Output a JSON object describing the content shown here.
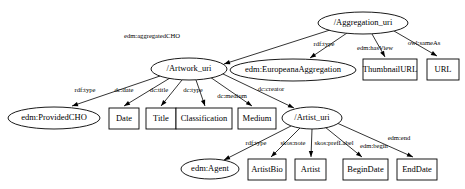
{
  "diagram": {
    "type": "rdf-graph",
    "background_color": "#ffffff",
    "stroke_color": "#000000",
    "nodes": [
      {
        "id": "aggregation_uri",
        "label": "/Aggregation_uri",
        "shape": "ellipse",
        "cx": 363,
        "cy": 23,
        "rx": 45,
        "ry": 11,
        "font_size": 8.5
      },
      {
        "id": "artwork_uri",
        "label": "/Artwork_uri",
        "shape": "ellipse",
        "cx": 189,
        "cy": 69,
        "rx": 38,
        "ry": 11,
        "font_size": 8.5
      },
      {
        "id": "europeana_agg",
        "label": "edm:EuropeanaAggregation",
        "shape": "ellipse",
        "cx": 293,
        "cy": 70,
        "rx": 63,
        "ry": 11,
        "font_size": 8.5
      },
      {
        "id": "thumbnail_url",
        "label": "ThumbnailURL",
        "shape": "rect",
        "x": 363,
        "y": 59,
        "w": 54,
        "h": 21,
        "font_size": 8.5
      },
      {
        "id": "url",
        "label": "URL",
        "shape": "rect",
        "x": 427,
        "y": 59,
        "w": 32,
        "h": 21,
        "font_size": 8.5
      },
      {
        "id": "provided_cho",
        "label": "edm:ProvidedCHO",
        "shape": "ellipse",
        "cx": 54,
        "cy": 118,
        "rx": 46,
        "ry": 11,
        "font_size": 8.5
      },
      {
        "id": "date",
        "label": "Date",
        "shape": "rect",
        "x": 109,
        "y": 108,
        "w": 30,
        "h": 21,
        "font_size": 8.5
      },
      {
        "id": "title",
        "label": "Title",
        "shape": "rect",
        "x": 146,
        "y": 108,
        "w": 30,
        "h": 21,
        "font_size": 8.5
      },
      {
        "id": "classification",
        "label": "Classification",
        "shape": "rect",
        "x": 176,
        "y": 108,
        "w": 56,
        "h": 21,
        "font_size": 8.5
      },
      {
        "id": "medium",
        "label": "Medium",
        "shape": "rect",
        "x": 238,
        "y": 108,
        "w": 38,
        "h": 21,
        "font_size": 8.5
      },
      {
        "id": "artist_uri",
        "label": "/Artist_uri",
        "shape": "ellipse",
        "cx": 312,
        "cy": 118,
        "rx": 30,
        "ry": 11,
        "font_size": 8.5
      },
      {
        "id": "agent",
        "label": "edm:Agent",
        "shape": "ellipse",
        "cx": 210,
        "cy": 169,
        "rx": 29,
        "ry": 10,
        "font_size": 8.5
      },
      {
        "id": "artist_bio",
        "label": "ArtistBio",
        "shape": "rect",
        "x": 248,
        "y": 159,
        "w": 38,
        "h": 21,
        "font_size": 8.5
      },
      {
        "id": "artist",
        "label": "Artist",
        "shape": "rect",
        "x": 295,
        "y": 159,
        "w": 31,
        "h": 21,
        "font_size": 8.5
      },
      {
        "id": "begin_date",
        "label": "BeginDate",
        "shape": "rect",
        "x": 343,
        "y": 159,
        "w": 45,
        "h": 21,
        "font_size": 8.5
      },
      {
        "id": "end_date",
        "label": "EndDate",
        "shape": "rect",
        "x": 397,
        "y": 159,
        "w": 40,
        "h": 21,
        "font_size": 8.5
      }
    ],
    "edges": [
      {
        "id": "e1",
        "from": "aggregation_uri",
        "to": "artwork_uri",
        "label": "edm:aggregatedCHO",
        "label_x": 152,
        "label_y": 36,
        "font_size": 6.6
      },
      {
        "id": "e2",
        "from": "aggregation_uri",
        "to": "europeana_agg",
        "label": "rdf:type",
        "label_x": 324,
        "label_y": 44,
        "font_size": 6.6
      },
      {
        "id": "e3",
        "from": "aggregation_uri",
        "to": "thumbnail_url",
        "label": "edm:hasView",
        "label_x": 375,
        "label_y": 48,
        "font_size": 6.6
      },
      {
        "id": "e4",
        "from": "aggregation_uri",
        "to": "url",
        "label": "owl:sameAs",
        "label_x": 424,
        "label_y": 43,
        "font_size": 6.6
      },
      {
        "id": "e5",
        "from": "artwork_uri",
        "to": "provided_cho",
        "label": "rdf:type",
        "label_x": 85,
        "label_y": 90,
        "font_size": 6.6
      },
      {
        "id": "e6",
        "from": "artwork_uri",
        "to": "date",
        "label": "dc:date",
        "label_x": 124,
        "label_y": 90,
        "font_size": 6.6
      },
      {
        "id": "e7",
        "from": "artwork_uri",
        "to": "title",
        "label": "dc:title",
        "label_x": 159,
        "label_y": 90,
        "font_size": 6.6
      },
      {
        "id": "e8",
        "from": "artwork_uri",
        "to": "classification",
        "label": "dc:type",
        "label_x": 193,
        "label_y": 90,
        "font_size": 6.6
      },
      {
        "id": "e9",
        "from": "artwork_uri",
        "to": "medium",
        "label": "dc:medium",
        "label_x": 232,
        "label_y": 96,
        "font_size": 6.6
      },
      {
        "id": "e10",
        "from": "artwork_uri",
        "to": "artist_uri",
        "label": "dc:creator",
        "label_x": 271,
        "label_y": 89,
        "font_size": 6.6
      },
      {
        "id": "e11",
        "from": "artist_uri",
        "to": "agent",
        "label": "rdf:type",
        "label_x": 256,
        "label_y": 143,
        "font_size": 6.6
      },
      {
        "id": "e12",
        "from": "artist_uri",
        "to": "artist_bio",
        "label": "skos:note",
        "label_x": 293,
        "label_y": 143,
        "font_size": 6.6
      },
      {
        "id": "e13",
        "from": "artist_uri",
        "to": "artist",
        "label": "skos:prefLabel",
        "label_x": 334,
        "label_y": 143,
        "font_size": 6.6
      },
      {
        "id": "e14",
        "from": "artist_uri",
        "to": "begin_date",
        "label": "edm:begin",
        "label_x": 374,
        "label_y": 146,
        "font_size": 6.6
      },
      {
        "id": "e15",
        "from": "artist_uri",
        "to": "end_date",
        "label": "edm:end",
        "label_x": 399,
        "label_y": 138,
        "font_size": 6.6
      }
    ],
    "edge_paths": [
      {
        "id": "e1",
        "d": "M 330 30 L 224 64",
        "arrow_at": [
          224,
          64
        ],
        "arrow_angle": 162
      },
      {
        "id": "e2",
        "d": "M 347 33 L 310 58",
        "arrow_at": [
          310,
          58
        ],
        "arrow_angle": 146
      },
      {
        "id": "e3",
        "d": "M 372 34 L 385 57",
        "arrow_at": [
          385,
          57
        ],
        "arrow_angle": 61
      },
      {
        "id": "e4",
        "d": "M 394 31 L 437 56",
        "arrow_at": [
          437,
          56
        ],
        "arrow_angle": 30
      },
      {
        "id": "e5",
        "d": "M 160 76 L 72 106",
        "arrow_at": [
          72,
          106
        ],
        "arrow_angle": 161
      },
      {
        "id": "e6",
        "d": "M 170 78 L 124 106",
        "arrow_at": [
          124,
          106
        ],
        "arrow_angle": 149
      },
      {
        "id": "e7",
        "d": "M 182 80 L 161 106",
        "arrow_at": [
          161,
          106
        ],
        "arrow_angle": 129
      },
      {
        "id": "e8",
        "d": "M 196 80 L 205 106",
        "arrow_at": [
          205,
          106
        ],
        "arrow_angle": 71
      },
      {
        "id": "e9",
        "d": "M 210 77 L 252 106",
        "arrow_at": [
          252,
          106
        ],
        "arrow_angle": 35
      },
      {
        "id": "e10",
        "d": "M 221 73 L 294 108",
        "arrow_at": [
          294,
          108
        ],
        "arrow_angle": 26
      },
      {
        "id": "e11",
        "d": "M 291 126 L 224 160",
        "arrow_at": [
          224,
          160
        ],
        "arrow_angle": 153
      },
      {
        "id": "e12",
        "d": "M 300 128 L 271 157",
        "arrow_at": [
          271,
          157
        ],
        "arrow_angle": 135
      },
      {
        "id": "e13",
        "d": "M 312 129 L 311 157",
        "arrow_at": [
          311,
          157
        ],
        "arrow_angle": 90
      },
      {
        "id": "e14",
        "d": "M 325 127 L 362 157",
        "arrow_at": [
          362,
          157
        ],
        "arrow_angle": 39
      },
      {
        "id": "e15",
        "d": "M 337 123 L 413 157",
        "arrow_at": [
          413,
          157
        ],
        "arrow_angle": 24
      }
    ]
  }
}
